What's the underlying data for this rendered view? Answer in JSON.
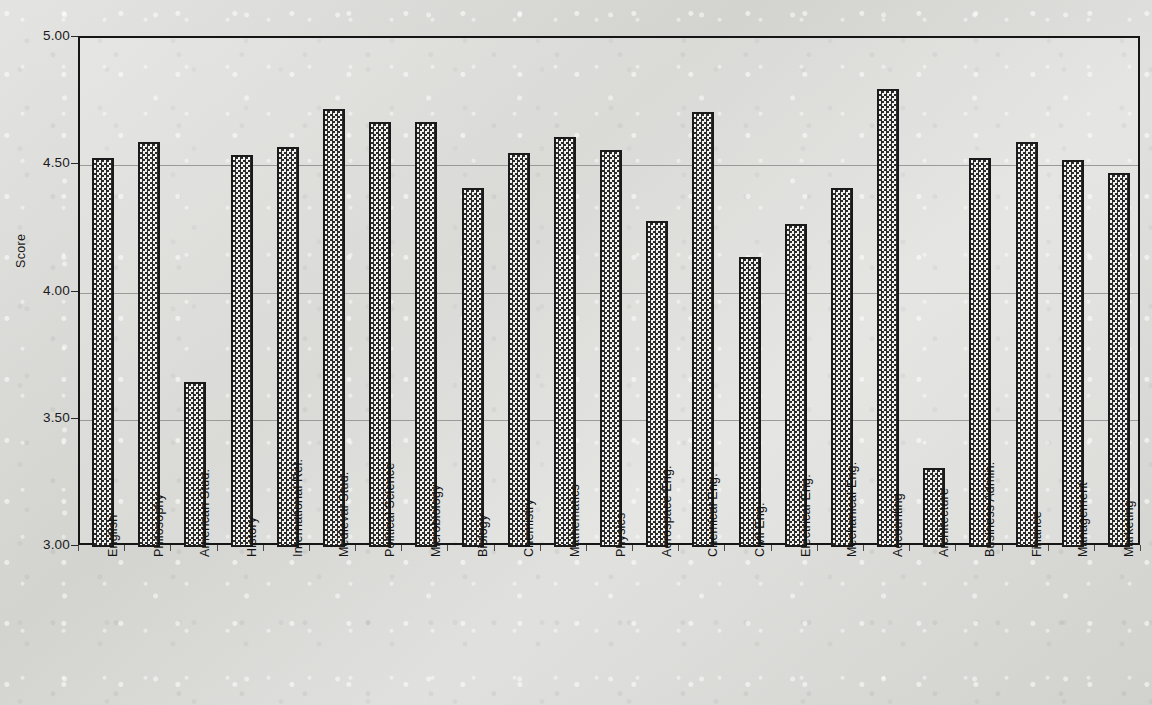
{
  "chart_data": {
    "type": "bar",
    "title": "",
    "xlabel": "",
    "ylabel": "Score",
    "ylim": [
      3.0,
      5.0
    ],
    "ytick_labels": [
      "5.00",
      "4.50",
      "4.00",
      "3.50",
      "3.00"
    ],
    "ytick_values": [
      5.0,
      4.5,
      4.0,
      3.5,
      3.0
    ],
    "grid": true,
    "legend": "none",
    "categories": [
      "English",
      "Philosophy",
      "American Stud.",
      "History",
      "International Rel.",
      "Medieval Stud.",
      "Political  Science",
      "Microbiology",
      "Biology",
      "Chemistry",
      "Mathematics",
      "Physics",
      "Aerospace Eng.",
      "Chemical Eng.",
      "Civil Eng.",
      "Electrical Eng.",
      "Mechanical Eng.",
      "Accounting",
      "Architecture",
      "Business Admin.",
      "Finance",
      "Management",
      "Marketing"
    ],
    "values": [
      4.53,
      4.59,
      3.65,
      4.54,
      4.57,
      4.72,
      4.67,
      4.67,
      4.41,
      4.55,
      4.61,
      4.56,
      4.28,
      4.71,
      4.14,
      4.27,
      4.41,
      4.8,
      3.31,
      4.53,
      4.59,
      4.52,
      4.47
    ]
  },
  "style": {
    "bar_fill": "#2b2b2b",
    "bar_edge": "#1a1a1a",
    "grid_color": "#9a9a98",
    "frame_color": "#161616",
    "text_color": "#141414",
    "page_background": "#d8d8d5"
  }
}
